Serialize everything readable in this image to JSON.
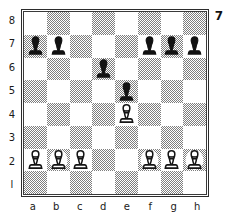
{
  "diagram": {
    "number_label": "7",
    "rank_labels": [
      "8",
      "7",
      "6",
      "5",
      "4",
      "3",
      "2",
      "l"
    ],
    "file_labels": [
      "a",
      "b",
      "c",
      "d",
      "e",
      "f",
      "g",
      "h"
    ],
    "colors": {
      "light_square": "#ffffff",
      "dark_square_dither": "#7e7e7e",
      "border": "#2b2b2b",
      "black_piece": "#121212",
      "white_piece_fill": "#ffffff",
      "white_piece_outline": "#141414",
      "text": "#1a1a1a"
    },
    "board": {
      "squares_per_side": 8,
      "a8_square_shade": "light",
      "a1_square_shade": "dark",
      "orientation": "white-bottom"
    },
    "pieces": [
      {
        "square": "a7",
        "piece": "pawn",
        "color": "black",
        "glyph": "black-pawn-icon"
      },
      {
        "square": "b7",
        "piece": "pawn",
        "color": "black",
        "glyph": "black-pawn-icon"
      },
      {
        "square": "f7",
        "piece": "pawn",
        "color": "black",
        "glyph": "black-pawn-icon"
      },
      {
        "square": "g7",
        "piece": "pawn",
        "color": "black",
        "glyph": "black-pawn-icon"
      },
      {
        "square": "h7",
        "piece": "pawn",
        "color": "black",
        "glyph": "black-pawn-icon"
      },
      {
        "square": "d6",
        "piece": "pawn",
        "color": "black",
        "glyph": "black-pawn-icon"
      },
      {
        "square": "e5",
        "piece": "pawn",
        "color": "black",
        "glyph": "black-pawn-icon"
      },
      {
        "square": "e4",
        "piece": "pawn",
        "color": "white",
        "glyph": "white-pawn-icon"
      },
      {
        "square": "a2",
        "piece": "pawn",
        "color": "white",
        "glyph": "white-pawn-icon"
      },
      {
        "square": "b2",
        "piece": "pawn",
        "color": "white",
        "glyph": "white-pawn-icon"
      },
      {
        "square": "c2",
        "piece": "pawn",
        "color": "white",
        "glyph": "white-pawn-icon"
      },
      {
        "square": "f2",
        "piece": "pawn",
        "color": "white",
        "glyph": "white-pawn-icon"
      },
      {
        "square": "g2",
        "piece": "pawn",
        "color": "white",
        "glyph": "white-pawn-icon"
      },
      {
        "square": "h2",
        "piece": "pawn",
        "color": "white",
        "glyph": "white-pawn-icon"
      }
    ]
  }
}
